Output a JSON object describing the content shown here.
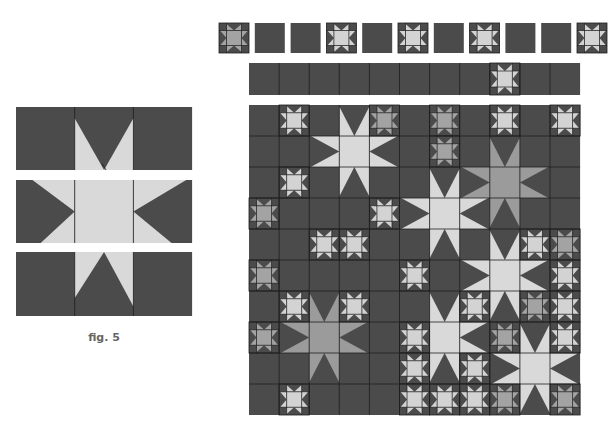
{
  "colors": {
    "background": "#ffffff",
    "dark": "#4b4b4b",
    "light": "#d9d9d9",
    "medium": "#9b9b9b",
    "small_light": "#d3d3d3",
    "small_medium": "#a3a3a3",
    "line": "#1e1e1e"
  },
  "figure5": {
    "caption": "fig. 5",
    "x": 16,
    "cell_w": 58.7,
    "rows": [
      {
        "y": 107,
        "h": 63,
        "kind": "top"
      },
      {
        "y": 180,
        "h": 63,
        "kind": "middle"
      },
      {
        "y": 252,
        "h": 64,
        "kind": "bottom"
      }
    ]
  },
  "top_blocks": {
    "y": 23,
    "size": 30,
    "start_x": 219,
    "step": 35.8,
    "items": [
      {
        "type": "star",
        "center": "medium"
      },
      {
        "type": "blank"
      },
      {
        "type": "blank"
      },
      {
        "type": "star",
        "center": "light"
      },
      {
        "type": "blank"
      },
      {
        "type": "star",
        "center": "light"
      },
      {
        "type": "blank"
      },
      {
        "type": "star",
        "center": "light"
      },
      {
        "type": "blank"
      },
      {
        "type": "blank"
      },
      {
        "type": "star",
        "center": "light"
      }
    ]
  },
  "strip": {
    "x": 249,
    "y": 63,
    "cell_w": 30.1,
    "h": 32,
    "cols": 11,
    "stars": [
      {
        "col": 8,
        "center": "light"
      }
    ]
  },
  "quilt": {
    "x": 249,
    "y": 105,
    "cols": 11,
    "rows": 10,
    "cell_w": 30.1,
    "cell_h": 31,
    "large_stars": [
      {
        "col": 3,
        "row": 1,
        "color": "light"
      },
      {
        "col": 8,
        "row": 2,
        "color": "medium"
      },
      {
        "col": 6,
        "row": 3,
        "color": "light"
      },
      {
        "col": 8,
        "row": 5,
        "color": "light"
      },
      {
        "col": 2,
        "row": 7,
        "color": "medium"
      },
      {
        "col": 6,
        "row": 7,
        "color": "light"
      },
      {
        "col": 9,
        "row": 8,
        "color": "light"
      }
    ],
    "small_stars": [
      {
        "col": 1,
        "row": 0,
        "center": "light"
      },
      {
        "col": 4,
        "row": 0,
        "center": "medium"
      },
      {
        "col": 6,
        "row": 0,
        "center": "medium"
      },
      {
        "col": 8,
        "row": 0,
        "center": "light"
      },
      {
        "col": 10,
        "row": 0,
        "center": "light"
      },
      {
        "col": 6,
        "row": 1,
        "center": "medium"
      },
      {
        "col": 1,
        "row": 2,
        "center": "light"
      },
      {
        "col": 0,
        "row": 3,
        "center": "medium"
      },
      {
        "col": 4,
        "row": 3,
        "center": "light"
      },
      {
        "col": 2,
        "row": 4,
        "center": "light"
      },
      {
        "col": 3,
        "row": 4,
        "center": "light"
      },
      {
        "col": 9,
        "row": 4,
        "center": "light"
      },
      {
        "col": 10,
        "row": 4,
        "center": "medium"
      },
      {
        "col": 0,
        "row": 5,
        "center": "medium"
      },
      {
        "col": 5,
        "row": 5,
        "center": "light"
      },
      {
        "col": 10,
        "row": 5,
        "center": "light"
      },
      {
        "col": 1,
        "row": 6,
        "center": "light"
      },
      {
        "col": 3,
        "row": 6,
        "center": "light"
      },
      {
        "col": 7,
        "row": 6,
        "center": "light"
      },
      {
        "col": 9,
        "row": 6,
        "center": "medium"
      },
      {
        "col": 10,
        "row": 6,
        "center": "light"
      },
      {
        "col": 0,
        "row": 7,
        "center": "medium"
      },
      {
        "col": 5,
        "row": 7,
        "center": "light"
      },
      {
        "col": 8,
        "row": 7,
        "center": "medium"
      },
      {
        "col": 10,
        "row": 7,
        "center": "light"
      },
      {
        "col": 5,
        "row": 8,
        "center": "light"
      },
      {
        "col": 7,
        "row": 8,
        "center": "light"
      },
      {
        "col": 1,
        "row": 9,
        "center": "light"
      },
      {
        "col": 5,
        "row": 9,
        "center": "light"
      },
      {
        "col": 6,
        "row": 9,
        "center": "light"
      },
      {
        "col": 7,
        "row": 9,
        "center": "light"
      },
      {
        "col": 8,
        "row": 9,
        "center": "medium"
      },
      {
        "col": 10,
        "row": 9,
        "center": "medium"
      }
    ]
  }
}
